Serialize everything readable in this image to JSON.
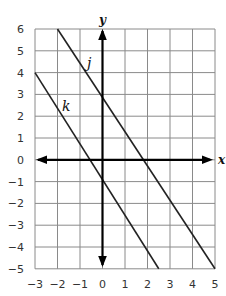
{
  "chart_data": {
    "type": "line",
    "title": "",
    "xlabel": "x",
    "ylabel": "y",
    "xlim": [
      -3,
      5
    ],
    "ylim": [
      -5,
      6
    ],
    "grid": true,
    "x_ticks": [
      "−3",
      "−2",
      "−1",
      "0",
      "1",
      "2",
      "3",
      "4",
      "5"
    ],
    "y_ticks": [
      "6",
      "5",
      "4",
      "3",
      "2",
      "1",
      "0",
      "−1",
      "−2",
      "−3",
      "−4",
      "−5"
    ],
    "series": [
      {
        "name": "j",
        "points": [
          [
            -2,
            6
          ],
          [
            0,
            3
          ],
          [
            2,
            0
          ],
          [
            5,
            -5
          ]
        ],
        "y_intercept": 3,
        "x_intercept": 2
      },
      {
        "name": "k",
        "points": [
          [
            -3,
            4
          ],
          [
            0,
            -1
          ],
          [
            2.5,
            -5
          ]
        ],
        "y_intercept": -1,
        "x_intercept": -0.6
      }
    ],
    "legend": "none (lines labeled inline)",
    "colors": {
      "grid": "#8a8a8a",
      "axis": "#000000",
      "line": "#222222",
      "text": "#333333"
    }
  }
}
